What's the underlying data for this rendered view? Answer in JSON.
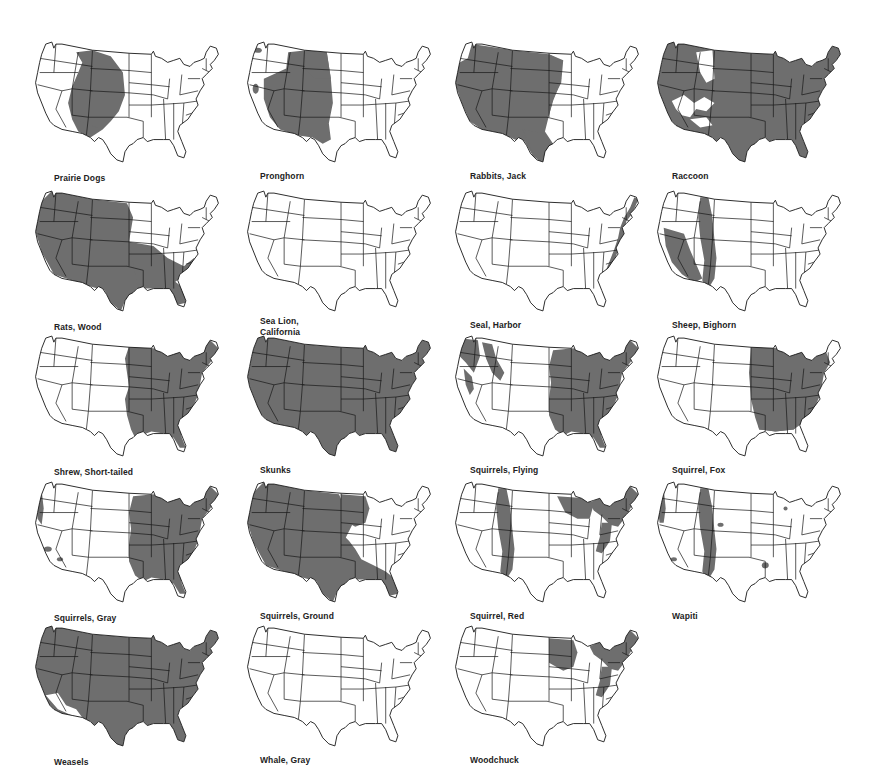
{
  "colors": {
    "range_fill": "#6e6e6e",
    "outline": "#1a1a1a",
    "land": "#ffffff",
    "background": "#ffffff"
  },
  "maps": [
    {
      "label": "Prairie Dogs",
      "range": [
        "great-plains",
        "southwest-plains"
      ]
    },
    {
      "label": "Pronghorn",
      "range": [
        "west-interior",
        "plains-west",
        "wa-spot",
        "ca-spot"
      ]
    },
    {
      "label": "Rabbits, Jack",
      "range": [
        "west-all-except-nw",
        "plains",
        "texas"
      ]
    },
    {
      "label": "Raccoon",
      "range": [
        "nearly-all-except-rockies-deserts"
      ]
    },
    {
      "label": "Rats, Wood",
      "range": [
        "west",
        "south",
        "southeast"
      ]
    },
    {
      "label": [
        "Sea Lion,",
        "California"
      ],
      "range": [
        "california-coast"
      ]
    },
    {
      "label": "Seal, Harbor",
      "range": [
        "pacific-coast",
        "atlantic-coast-north"
      ]
    },
    {
      "label": "Sheep, Bighorn",
      "range": [
        "rockies",
        "great-basin-south"
      ]
    },
    {
      "label": "Shrew, Short-tailed",
      "range": [
        "east-of-plains"
      ]
    },
    {
      "label": "Skunks",
      "range": [
        "all"
      ]
    },
    {
      "label": "Squirrels, Flying",
      "range": [
        "east",
        "pacific-northwest",
        "sierra",
        "rockies-north"
      ]
    },
    {
      "label": "Squirrel, Fox",
      "range": [
        "east-central",
        "south"
      ]
    },
    {
      "label": "Squirrels, Gray",
      "range": [
        "east",
        "pacific-coast-spots"
      ]
    },
    {
      "label": "Squirrels, Ground",
      "range": [
        "west",
        "plains",
        "midwest"
      ]
    },
    {
      "label": "Squirrel, Red",
      "range": [
        "northeast",
        "rockies",
        "great-lakes",
        "appalachians"
      ]
    },
    {
      "label": "Wapiti",
      "range": [
        "pacific-northwest-coast",
        "rockies",
        "scattered-spots"
      ]
    },
    {
      "label": "Weasels",
      "range": [
        "nearly-all-except-southwest-deserts"
      ]
    },
    {
      "label": "Whale, Gray",
      "range": [
        "pacific-coast"
      ]
    },
    {
      "label": "Woodchuck",
      "range": [
        "northeast",
        "midwest",
        "appalachians"
      ]
    }
  ]
}
